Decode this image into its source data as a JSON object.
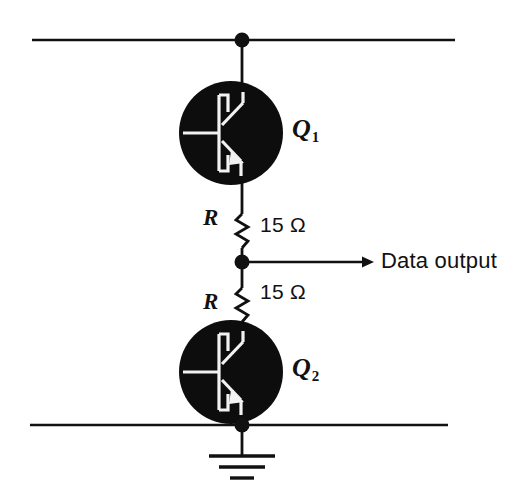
{
  "figure": {
    "kind": "schematic-diagram",
    "background_color": "#ffffff",
    "ink_color": "#111111"
  },
  "components": {
    "transistor_top": {
      "name": "transistor-q1",
      "label": "Q",
      "subscript": "1",
      "type": "npn-bipolar-transistor",
      "body_color": "#0d0d0d",
      "symbol_color": "#f2f2f2",
      "center_x": 231,
      "center_y": 133,
      "radius": 52
    },
    "transistor_bottom": {
      "name": "transistor-q2",
      "label": "Q",
      "subscript": "2",
      "type": "npn-bipolar-transistor",
      "body_color": "#0d0d0d",
      "symbol_color": "#f2f2f2",
      "center_x": 231,
      "center_y": 372,
      "radius": 52
    },
    "resistor_top": {
      "name": "resistor-r-upper",
      "label": "R",
      "value": "15 Ω"
    },
    "resistor_bottom": {
      "name": "resistor-r-lower",
      "label": "R",
      "value": "15 Ω"
    }
  },
  "nets": {
    "supply_rail": {
      "name": "supply-rail",
      "y": 40,
      "x_start": 32,
      "x_end": 455
    },
    "ground_rail": {
      "name": "ground-rail",
      "y": 425,
      "x_start": 30,
      "x_end": 448
    },
    "output_node": {
      "name": "output-node",
      "x": 242,
      "y": 262
    },
    "output_label": "Data output",
    "ground_symbol": "earth-ground"
  },
  "junction_dots": [
    {
      "name": "junction-supply",
      "x": 242,
      "y": 40
    },
    {
      "name": "junction-output",
      "x": 242,
      "y": 262
    },
    {
      "name": "junction-ground",
      "x": 242,
      "y": 425
    }
  ]
}
